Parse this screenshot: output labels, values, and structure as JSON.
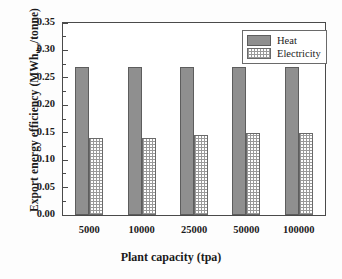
{
  "chart_data": {
    "type": "bar",
    "title": "",
    "xlabel": "Plant capacity (tpa)",
    "ylabel_prefix": "Export energy efficiency (MWh",
    "ylabel_sub": "th,e",
    "ylabel_suffix": "/tonne)",
    "ylabel_full": "Export energy efficiency (MWhth,e/tonne)",
    "categories": [
      "5000",
      "10000",
      "25000",
      "50000",
      "100000"
    ],
    "series": [
      {
        "name": "Heat",
        "values": [
          0.27,
          0.27,
          0.27,
          0.269,
          0.269
        ],
        "color": "#8f8f8f",
        "pattern": "solid"
      },
      {
        "name": "Electricity",
        "values": [
          0.141,
          0.141,
          0.145,
          0.15,
          0.149
        ],
        "color": "#ffffff",
        "pattern": "checker"
      }
    ],
    "ylim": [
      0.0,
      0.35
    ],
    "ytick_values": [
      0.0,
      0.05,
      0.1,
      0.15,
      0.2,
      0.25,
      0.3,
      0.35
    ],
    "ytick_labels": [
      "0.00",
      "0.05",
      "0.10",
      "0.15",
      "0.20",
      "0.25",
      "0.30",
      "0.35"
    ],
    "yminor_values": [
      0.025,
      0.075,
      0.125,
      0.175,
      0.225,
      0.275,
      0.325
    ],
    "grid": false,
    "legend_position": "top-right",
    "legend_entries": [
      "Heat",
      "Electricity"
    ]
  }
}
